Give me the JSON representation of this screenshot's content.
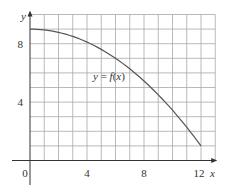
{
  "chart_data": {
    "type": "line",
    "title": "",
    "xlabel": "x",
    "ylabel": "y",
    "xlim": [
      0,
      13
    ],
    "ylim": [
      0,
      10
    ],
    "grid": true,
    "x_ticks": [
      0,
      4,
      8,
      12
    ],
    "y_ticks": [
      4,
      8
    ],
    "x_tick_labels": [
      "0",
      "4",
      "8",
      "12"
    ],
    "y_tick_labels": [
      "4",
      "8"
    ],
    "annotation": "y = f(x)",
    "series": [
      {
        "name": "y = f(x)",
        "x": [
          0,
          1,
          2,
          3,
          4,
          5,
          6,
          7,
          8,
          9,
          10,
          11,
          12
        ],
        "y": [
          9,
          8.94,
          8.78,
          8.5,
          8.11,
          7.61,
          7,
          6.28,
          5.44,
          4.5,
          3.44,
          2.28,
          1
        ]
      }
    ],
    "colors": {
      "grid": "#a8a8a8",
      "axis": "#333333",
      "curve": "#555555"
    }
  },
  "labels": {
    "x_axis": "x",
    "y_axis": "y",
    "origin": "0",
    "annotation": "y = f(x)"
  }
}
